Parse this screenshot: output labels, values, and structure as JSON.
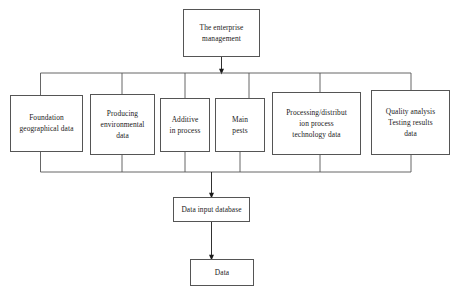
{
  "diagram": {
    "type": "flowchart",
    "stroke_color": "#555555",
    "text_color": "#1a1a1a",
    "background": "#ffffff",
    "nodes": {
      "root": {
        "id": "the-enterprise-management",
        "lines": [
          "The enterprise",
          "management"
        ]
      },
      "sources": [
        {
          "id": "foundation-geographical-data",
          "lines": [
            "Foundation",
            "geographical data"
          ]
        },
        {
          "id": "producing-environmental-data",
          "lines": [
            "Producing",
            "environmental",
            "data"
          ]
        },
        {
          "id": "additive-in-process",
          "lines": [
            "Additive",
            "in process"
          ]
        },
        {
          "id": "main-pests",
          "lines": [
            "Main",
            "pests"
          ]
        },
        {
          "id": "processing-distribution-process-technology-data",
          "lines": [
            "Processing/distribut",
            "ion process",
            "technology data"
          ]
        },
        {
          "id": "quality-analysis-testing-results-data",
          "lines": [
            "Quality analysis",
            "Testing results",
            "data"
          ]
        }
      ],
      "collector": {
        "id": "data-input-database",
        "lines": [
          "Data input database"
        ]
      },
      "sink": {
        "id": "data",
        "lines": [
          "Data"
        ]
      }
    }
  }
}
